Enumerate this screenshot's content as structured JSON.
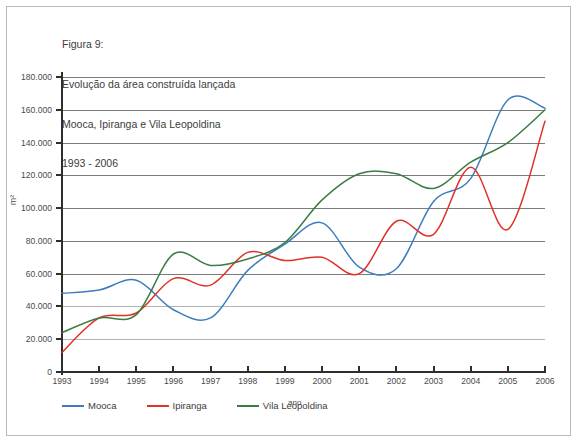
{
  "figure": {
    "caption_lines": [
      "Figura 9:",
      "Evolução da área construída lançada",
      "Mooca, Ipiranga e Vila Leopoldina",
      "1993 - 2006"
    ],
    "caption_line_1": "Figura 9:",
    "caption_line_2": "Evolução da área construída lançada",
    "caption_line_3": "Mooca, Ipiranga e Vila Leopoldina",
    "caption_line_4": "1993 - 2006"
  },
  "chart_data": {
    "type": "line",
    "title": "Evolução da área construída lançada",
    "subtitle": "Mooca, Ipiranga e Vila Leopoldina 1993 - 2006",
    "xlabel": "ano",
    "ylabel": "m²",
    "x": [
      1993,
      1994,
      1995,
      1996,
      1997,
      1998,
      1999,
      2000,
      2001,
      2002,
      2003,
      2004,
      2005,
      2006
    ],
    "categories": [
      "1993",
      "1994",
      "1995",
      "1996",
      "1997",
      "1998",
      "1999",
      "2000",
      "2001",
      "2002",
      "2003",
      "2004",
      "2005",
      "2006"
    ],
    "ylim": [
      0,
      180000
    ],
    "xlim": [
      1993,
      2006
    ],
    "ytick_labels": [
      "180.000",
      "160.000",
      "140.000",
      "120.000",
      "100.000",
      "80.000",
      "60.000",
      "40.000",
      "20.000",
      "0"
    ],
    "ytick_values": [
      180000,
      160000,
      140000,
      120000,
      100000,
      80000,
      60000,
      40000,
      20000,
      0
    ],
    "grid": true,
    "legend_position": "bottom-left",
    "series": [
      {
        "name": "Mooca",
        "color": "#3d7dbf",
        "values": [
          48000,
          50000,
          56000,
          38000,
          33000,
          62000,
          78000,
          91000,
          64000,
          63000,
          104000,
          118000,
          166000,
          161000
        ]
      },
      {
        "name": "Ipiranga",
        "color": "#e03127",
        "values": [
          12000,
          33000,
          36000,
          57000,
          53000,
          73000,
          68000,
          70000,
          60000,
          92000,
          84000,
          125000,
          87000,
          153000
        ]
      },
      {
        "name": "Vila Leopoldina",
        "color": "#3a7d44",
        "values": [
          24000,
          33000,
          35000,
          72000,
          65000,
          69000,
          79000,
          105000,
          121000,
          121000,
          112000,
          128000,
          140000,
          160000
        ]
      }
    ]
  },
  "legend": {
    "items": [
      {
        "label": "Mooca",
        "color": "#3d7dbf"
      },
      {
        "label": "Ipiranga",
        "color": "#e03127"
      },
      {
        "label": "Vila Leopoldina",
        "color": "#3a7d44"
      }
    ]
  },
  "axes": {
    "y_axis_title": "m²",
    "x_axis_title": "ano"
  }
}
